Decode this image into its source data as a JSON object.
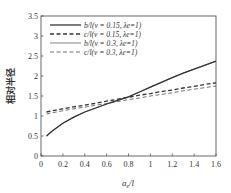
{
  "chart_data": {
    "type": "line",
    "title": "",
    "xlabel": "a_e/l",
    "ylabel": "相对半径",
    "xlim": [
      0,
      1.6
    ],
    "ylim": [
      0,
      3.5
    ],
    "xticks": [
      "0",
      "0.2",
      "0.4",
      "0.6",
      "0.8",
      "1",
      "1.2",
      "1.4",
      "1.6"
    ],
    "yticks": [
      "0",
      "0.5",
      "1",
      "1.5",
      "2",
      "2.5",
      "3",
      "3.5"
    ],
    "grid": false,
    "legend_position": "upper left",
    "x": [
      0.05,
      0.1,
      0.2,
      0.3,
      0.4,
      0.5,
      0.6,
      0.7,
      0.8,
      0.9,
      1.0,
      1.1,
      1.2,
      1.3,
      1.4,
      1.5,
      1.6
    ],
    "series": [
      {
        "name": "b/l(ν = 0.15, λe=1)",
        "style": "solid-thick",
        "values": [
          0.5,
          0.62,
          0.82,
          0.97,
          1.1,
          1.2,
          1.3,
          1.39,
          1.48,
          1.6,
          1.72,
          1.84,
          1.96,
          2.07,
          2.17,
          2.27,
          2.37
        ]
      },
      {
        "name": "c/l(ν = 0.15, λe=1)",
        "style": "dashed-thick",
        "values": [
          1.1,
          1.13,
          1.18,
          1.23,
          1.27,
          1.32,
          1.37,
          1.42,
          1.47,
          1.52,
          1.56,
          1.61,
          1.65,
          1.7,
          1.74,
          1.79,
          1.83
        ]
      },
      {
        "name": "b/l(ν = 0.3, λe=1)",
        "style": "solid-thin",
        "values": [
          0.5,
          0.62,
          0.82,
          0.97,
          1.1,
          1.2,
          1.3,
          1.39,
          1.48,
          1.6,
          1.72,
          1.84,
          1.96,
          2.07,
          2.17,
          2.27,
          2.37
        ]
      },
      {
        "name": "c/l(ν = 0.3, λe=1)",
        "style": "dashed-thin",
        "values": [
          1.05,
          1.08,
          1.13,
          1.18,
          1.22,
          1.27,
          1.31,
          1.36,
          1.41,
          1.45,
          1.5,
          1.54,
          1.58,
          1.63,
          1.67,
          1.71,
          1.75
        ]
      }
    ]
  },
  "legend": [
    {
      "label": "b/l(ν = 0.15, λe=1)"
    },
    {
      "label": "c/l(ν = 0.15, λe=1)"
    },
    {
      "label": "b/l(ν = 0.3, λe=1)"
    },
    {
      "label": "c/l(ν = 0.3, λe=1)"
    }
  ],
  "axes": {
    "xlabel": "ae/l",
    "ylabel": "相对半径"
  }
}
